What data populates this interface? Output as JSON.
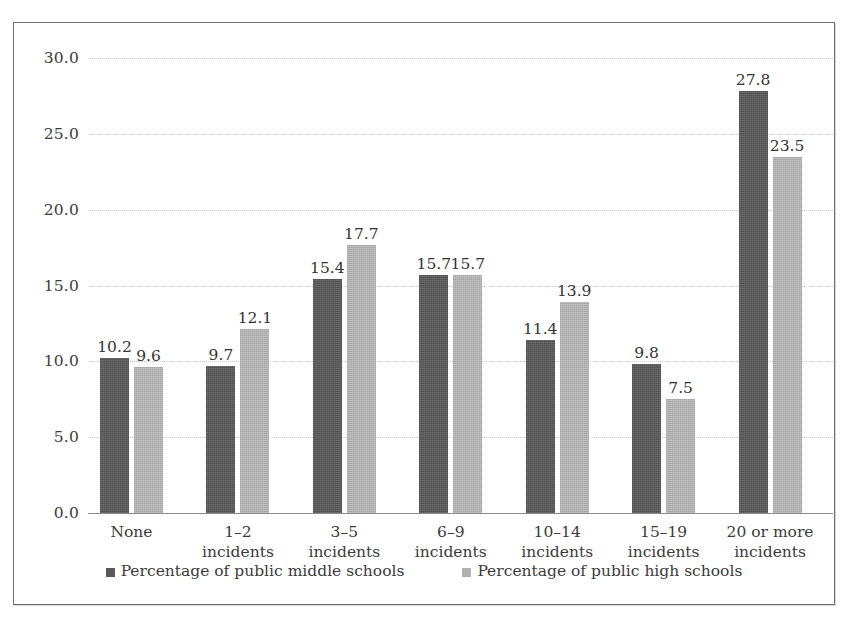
{
  "chart_data": {
    "type": "bar",
    "title": "",
    "subtitle": "",
    "xlabel": "",
    "ylabel": "",
    "ylim": [
      0,
      30
    ],
    "yticks": [
      "0.0",
      "5.0",
      "10.0",
      "15.0",
      "20.0",
      "25.0",
      "30.0"
    ],
    "ytick_values": [
      0,
      5,
      10,
      15,
      20,
      25,
      30
    ],
    "grid": true,
    "legend_position": "bottom",
    "categories": [
      "None",
      "1–2\nincidents",
      "3–5\nincidents",
      "6–9\nincidents",
      "10–14\nincidents",
      "15–19\nincidents",
      "20 or more\nincidents"
    ],
    "series": [
      {
        "name": "Percentage of public middle schools",
        "color": "#5a5a5a",
        "values": [
          10.2,
          9.7,
          15.4,
          15.7,
          11.4,
          9.8,
          27.8
        ],
        "labels": [
          "10.2",
          "9.7",
          "15.4",
          "15.7",
          "11.4",
          "9.8",
          "27.8"
        ]
      },
      {
        "name": "Percentage of public high schools",
        "color": "#b1b1b1",
        "values": [
          9.6,
          12.1,
          17.7,
          15.7,
          13.9,
          7.5,
          23.5
        ],
        "labels": [
          "9.6",
          "12.1",
          "17.7",
          "15.7",
          "13.9",
          "7.5",
          "23.5"
        ]
      }
    ]
  },
  "legend": {
    "items": [
      {
        "label": "Percentage of public middle schools",
        "swatch": "legend-swatch-middle-schools"
      },
      {
        "label": "Percentage of public high schools",
        "swatch": "legend-swatch-high-schools"
      }
    ]
  }
}
